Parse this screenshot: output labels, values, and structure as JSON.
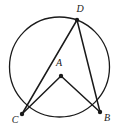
{
  "figure": {
    "background_color": "#ffffff",
    "stroke_color": "#1a1a1a",
    "label_color": "#1a1a1a"
  },
  "chart_data": {
    "type": "diagram",
    "subtype": "euclidean-geometry",
    "canvas": {
      "width": 123,
      "height": 133
    },
    "circle": {
      "name": "circle-A",
      "center_label": "A",
      "cx": 59.5,
      "cy": 67,
      "r": 50,
      "stroke": "#1a1a1a",
      "stroke_width": 1.3,
      "fill": "none"
    },
    "points": [
      {
        "label": "A",
        "x": 61,
        "y": 76,
        "on_circle": false,
        "role": "center",
        "dot": true,
        "label_x": 59,
        "label_y": 63
      },
      {
        "label": "D",
        "x": 77,
        "y": 20,
        "on_circle": true,
        "role": "vertex",
        "dot": true,
        "label_x": 80,
        "label_y": 9
      },
      {
        "label": "C",
        "x": 22,
        "y": 114,
        "on_circle": true,
        "role": "vertex",
        "dot": true,
        "label_x": 15,
        "label_y": 120
      },
      {
        "label": "B",
        "x": 100,
        "y": 112,
        "on_circle": true,
        "role": "vertex",
        "dot": true,
        "label_x": 107,
        "label_y": 118
      }
    ],
    "segments": [
      {
        "name": "segment-DC",
        "from": "D",
        "to": "C",
        "x1": 77,
        "y1": 20,
        "x2": 22,
        "y2": 114,
        "kind": "chord"
      },
      {
        "name": "segment-DB",
        "from": "D",
        "to": "B",
        "x1": 77,
        "y1": 20,
        "x2": 100,
        "y2": 112,
        "kind": "chord"
      },
      {
        "name": "segment-AC",
        "from": "A",
        "to": "C",
        "x1": 61,
        "y1": 76,
        "x2": 22,
        "y2": 114,
        "kind": "radius"
      },
      {
        "name": "segment-AB",
        "from": "A",
        "to": "B",
        "x1": 61,
        "y1": 76,
        "x2": 100,
        "y2": 112,
        "kind": "radius"
      }
    ],
    "angles": [
      {
        "name": "central-angle-CAB",
        "vertex": "A",
        "rays": [
          "C",
          "B"
        ]
      },
      {
        "name": "inscribed-angle-CDB",
        "vertex": "D",
        "rays": [
          "C",
          "B"
        ]
      }
    ],
    "dot_radius": 2.2,
    "labels": [
      "A",
      "B",
      "C",
      "D"
    ]
  }
}
